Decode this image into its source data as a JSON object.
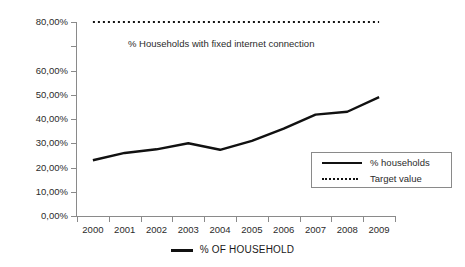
{
  "chart_data": {
    "type": "line",
    "title": "",
    "subtitle": "",
    "xlabel": "",
    "ylabel": "",
    "grid": false,
    "legend_position": "inside-bottom-right",
    "categories": [
      "2000",
      "2001",
      "2002",
      "2003",
      "2004",
      "2005",
      "2006",
      "2007",
      "2008",
      "2009"
    ],
    "ylim": [
      0,
      80
    ],
    "ytick_values": [
      0,
      10,
      20,
      30,
      40,
      50,
      60,
      70,
      80
    ],
    "ytick_labels": [
      "0,00%",
      "10,00%",
      "20,00%",
      "30,00%",
      "40,00%",
      "50,00%",
      "60,00%",
      "",
      "80,00%"
    ],
    "series": [
      {
        "name": "% households",
        "style": "solid",
        "color": "#111111",
        "values": [
          23.0,
          26.0,
          27.5,
          30.0,
          27.3,
          31.0,
          36.0,
          41.8,
          43.0,
          49.0
        ]
      },
      {
        "name": "Target value",
        "style": "dotted",
        "color": "#111111",
        "values": [
          80.0,
          80.0,
          80.0,
          80.0,
          80.0,
          80.0,
          80.0,
          80.0,
          80.0,
          80.0
        ]
      }
    ],
    "annotations": [
      {
        "text": "% Households with fixed internet connection",
        "x": "2002",
        "y": 73
      }
    ]
  },
  "legend": {
    "entries": [
      {
        "label": "% households",
        "marker": "solid-line-swatch"
      },
      {
        "label": "Target value",
        "marker": "dotted-line-swatch"
      }
    ]
  },
  "bottom_legend": {
    "label": "% OF HOUSEHOLD",
    "marker": "solid-line-swatch"
  },
  "colors": {
    "series_line": "#111111",
    "target_line": "#111111",
    "axis": "#8a8a8a",
    "text": "#2b2b2b",
    "background": "#ffffff"
  }
}
